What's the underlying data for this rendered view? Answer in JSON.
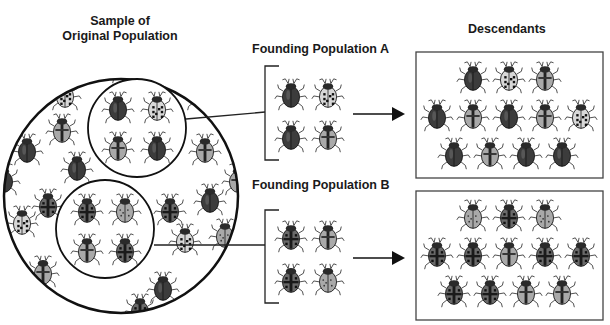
{
  "labels": {
    "original": [
      "Sample of",
      "Original Population"
    ],
    "founding_a": "Founding Population A",
    "founding_b": "Founding Population B",
    "descendants": "Descendants"
  },
  "colors": {
    "ink": "#1a1a1a",
    "dark_beetle": "#3c3c3c",
    "medium_beetle": "#6a6a6a",
    "light_beetle": "#a9a9a9",
    "spot_beetle": "#d8d8d8"
  },
  "beetle_types": {
    "D": "dark solid",
    "L": "light with dark stripe",
    "S": "pale with dark spots",
    "M": "medium with cross pattern",
    "P": "pale grey with small spots"
  },
  "original_population": {
    "inner_circle_a": [
      "D",
      "S",
      "L",
      "D"
    ],
    "inner_circle_b": [
      "M",
      "P",
      "L",
      "M"
    ]
  },
  "founding_population_a": [
    "D",
    "S",
    "D",
    "L"
  ],
  "founding_population_b": [
    "M",
    "L",
    "M",
    "P"
  ],
  "descendants_a": [
    [
      "D",
      "S",
      "L"
    ],
    [
      "D",
      "L",
      "D",
      "L",
      "S"
    ],
    [
      "D",
      "L",
      "D",
      "D"
    ]
  ],
  "descendants_b": [
    [
      "P",
      "M",
      "P"
    ],
    [
      "M",
      "M",
      "L",
      "M",
      "M"
    ],
    [
      "M",
      "M",
      "L",
      "L"
    ]
  ]
}
